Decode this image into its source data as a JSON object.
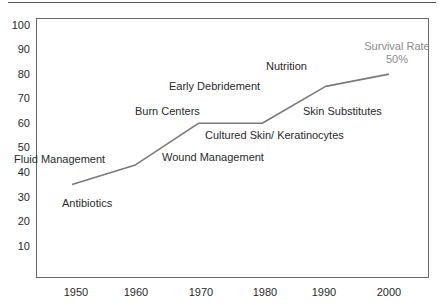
{
  "chart_data": {
    "type": "line",
    "title": "",
    "xlabel": "",
    "ylabel": "",
    "x": [
      1950,
      1960,
      1970,
      1980,
      1990,
      2000
    ],
    "categories": [
      "1950",
      "1960",
      "1970",
      "1980",
      "1990",
      "2000"
    ],
    "series": [
      {
        "name": "Survival Rate",
        "values": [
          35,
          43,
          60,
          60,
          75,
          80
        ]
      }
    ],
    "xlim": [
      1945,
      2005
    ],
    "ylim": [
      0,
      100
    ],
    "yticks": [
      "100",
      "90",
      "80",
      "70",
      "60",
      "50",
      "40",
      "30",
      "20",
      "10"
    ],
    "grid": false,
    "legend": "none",
    "line_color": "#7a7a7a",
    "annotations": [
      {
        "text": "Fluid Management",
        "near_x": 1950,
        "near_y": 46
      },
      {
        "text": "Antibiotics",
        "near_x": 1950,
        "near_y": 27
      },
      {
        "text": "Burn Centers",
        "near_x": 1960,
        "near_y": 62
      },
      {
        "text": "Wound Management",
        "near_x": 1965,
        "near_y": 45
      },
      {
        "text": "Early Debridement",
        "near_x": 1972,
        "near_y": 72
      },
      {
        "text": "Cultured Skin/ Keratinocytes",
        "near_x": 1975,
        "near_y": 52
      },
      {
        "text": "Nutrition",
        "near_x": 1982,
        "near_y": 76
      },
      {
        "text": "Skin Substitutes",
        "near_x": 1988,
        "near_y": 62
      },
      {
        "text": "Survival Rate 50%",
        "near_x": 2000,
        "near_y": 88
      }
    ]
  },
  "labels": {
    "y": [
      "100",
      "90",
      "80",
      "70",
      "60",
      "50",
      "40",
      "30",
      "20",
      "10"
    ],
    "x": [
      "1950",
      "1960",
      "1970",
      "1980",
      "1990",
      "2000"
    ],
    "fluid": "Fluid Management",
    "antibiotics": "Antibiotics",
    "burn_centers": "Burn Centers",
    "wound": "Wound Management",
    "debridement": "Early Debridement",
    "cultured": "Cultured Skin/ Keratinocytes",
    "nutrition": "Nutrition",
    "substitutes": "Skin Substitutes",
    "survival_line1": "Survival Rate",
    "survival_line2": "50%"
  }
}
